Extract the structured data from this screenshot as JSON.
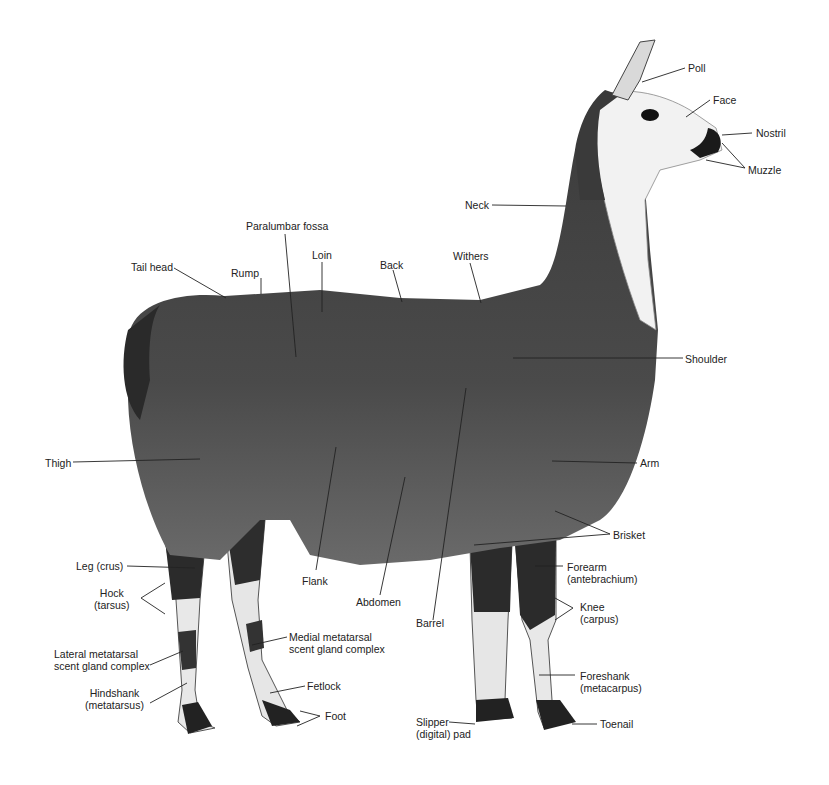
{
  "figure": {
    "labels": {
      "poll": "Poll",
      "face": "Face",
      "nostril": "Nostril",
      "muzzle": "Muzzle",
      "neck": "Neck",
      "paralumbar_fossa": "Paralumbar fossa",
      "loin": "Loin",
      "tail_head": "Tail head",
      "rump": "Rump",
      "back": "Back",
      "withers": "Withers",
      "shoulder": "Shoulder",
      "thigh": "Thigh",
      "arm": "Arm",
      "brisket": "Brisket",
      "leg_crus": "Leg (crus)",
      "flank": "Flank",
      "forearm_1": "Forearm",
      "forearm_2": "(antebrachium)",
      "hock_1": "Hock",
      "hock_2": "(tarsus)",
      "abdomen": "Abdomen",
      "knee_1": "Knee",
      "knee_2": "(carpus)",
      "barrel": "Barrel",
      "medial_1": "Medial metatarsal",
      "medial_2": "scent gland complex",
      "lateral_1": "Lateral metatarsal",
      "lateral_2": "scent gland complex",
      "foreshank_1": "Foreshank",
      "foreshank_2": "(metacarpus)",
      "fetlock": "Fetlock",
      "hindshank_1": "Hindshank",
      "hindshank_2": "(metatarsus)",
      "foot": "Foot",
      "slipper_1": "Slipper",
      "slipper_2": "(digital) pad",
      "toenail": "Toenail"
    },
    "colors": {
      "fur_dark": "#3a3a3a",
      "fur_mid": "#4d4d4d",
      "white_patch": "#f2f2f2",
      "leader_line": "#222222"
    }
  }
}
